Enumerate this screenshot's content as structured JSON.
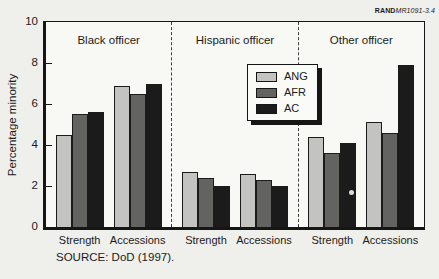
{
  "figure": {
    "rand_label_bold": "RAND",
    "rand_label_italic": "MR1091-3.4",
    "source": "SOURCE:  DoD (1997)."
  },
  "chart_data": {
    "type": "bar",
    "title": "",
    "ylabel": "Percentage minority",
    "ylim": [
      0,
      10
    ],
    "yticks": [
      0,
      2,
      4,
      6,
      8,
      10
    ],
    "grid": false,
    "legend_position": "upper center-right inside plot",
    "series_names": [
      "ANG",
      "AFR",
      "AC"
    ],
    "series_colors": {
      "ANG": "#c3c3c0",
      "AFR": "#636360",
      "AC": "#1b1b1b"
    },
    "panels": [
      {
        "title": "Black officer",
        "groups": [
          {
            "label": "Strength",
            "values": {
              "ANG": 4.5,
              "AFR": 5.5,
              "AC": 5.6
            }
          },
          {
            "label": "Accessions",
            "values": {
              "ANG": 6.9,
              "AFR": 6.5,
              "AC": 7.0
            }
          }
        ]
      },
      {
        "title": "Hispanic officer",
        "groups": [
          {
            "label": "Strength",
            "values": {
              "ANG": 2.7,
              "AFR": 2.4,
              "AC": 2.0
            }
          },
          {
            "label": "Accessions",
            "values": {
              "ANG": 2.6,
              "AFR": 2.3,
              "AC": 2.0
            }
          }
        ]
      },
      {
        "title": "Other officer",
        "groups": [
          {
            "label": "Strength",
            "values": {
              "ANG": 4.4,
              "AFR": 3.6,
              "AC": 4.1
            }
          },
          {
            "label": "Accessions",
            "values": {
              "ANG": 5.1,
              "AFR": 4.6,
              "AC": 7.9
            }
          }
        ]
      }
    ],
    "legend": {
      "entries": [
        "ANG",
        "AFR",
        "AC"
      ]
    }
  }
}
